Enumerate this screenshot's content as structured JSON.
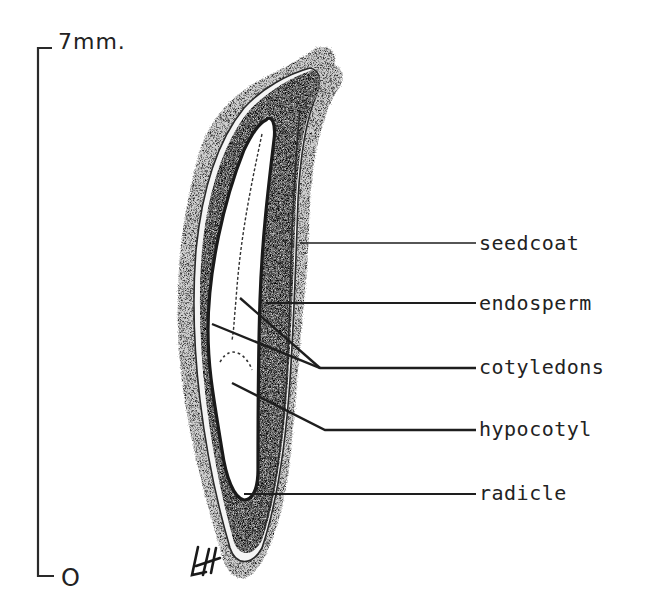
{
  "figure": {
    "type": "labeled botanical cross-section of a seed",
    "ink_color": "#222222",
    "stipple_color": "#3a3a3a",
    "background": "#ffffff"
  },
  "scale_bar": {
    "top_label": "7mm.",
    "bottom_label": "O"
  },
  "labels": [
    {
      "id": "seedcoat",
      "text": "seedcoat"
    },
    {
      "id": "endosperm",
      "text": "endosperm"
    },
    {
      "id": "cotyledons",
      "text": "cotyledons"
    },
    {
      "id": "hypocotyl",
      "text": "hypocotyl"
    },
    {
      "id": "radicle",
      "text": "radicle"
    }
  ],
  "signature": {
    "initials": "LH"
  }
}
